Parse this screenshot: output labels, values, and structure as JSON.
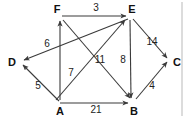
{
  "diagram": {
    "type": "directed-weighted-graph",
    "nodes": [
      {
        "id": "F",
        "label": "F",
        "x": 60,
        "y": 14,
        "lx": 57,
        "ly": 18
      },
      {
        "id": "E",
        "label": "E",
        "x": 130,
        "y": 14,
        "lx": 127,
        "ly": 18
      },
      {
        "id": "D",
        "label": "D",
        "x": 18,
        "y": 62,
        "lx": 9,
        "ly": 66
      },
      {
        "id": "C",
        "label": "C",
        "x": 171,
        "y": 62,
        "lx": 174,
        "ly": 66
      },
      {
        "id": "A",
        "label": "A",
        "x": 60,
        "y": 103,
        "lx": 56,
        "ly": 114
      },
      {
        "id": "B",
        "label": "B",
        "x": 133,
        "y": 103,
        "lx": 130,
        "ly": 114
      }
    ],
    "edges": [
      {
        "from": "F",
        "to": "E",
        "weight": "3",
        "lx": 96,
        "ly": 11
      },
      {
        "from": "E",
        "to": "D",
        "weight": "6",
        "lx": 47,
        "ly": 47
      },
      {
        "from": "A",
        "to": "F",
        "weight": "7",
        "lx": 71,
        "ly": 76
      },
      {
        "from": "F",
        "to": "B",
        "weight": "11",
        "lx": 100,
        "ly": 63
      },
      {
        "from": "A",
        "to": "E",
        "weight": "",
        "lx": 0,
        "ly": 0
      },
      {
        "from": "E",
        "to": "B",
        "weight": "8",
        "lx": 123,
        "ly": 63
      },
      {
        "from": "E",
        "to": "C",
        "weight": "14",
        "lx": 152,
        "ly": 45
      },
      {
        "from": "B",
        "to": "C",
        "weight": "4",
        "lx": 152,
        "ly": 89
      },
      {
        "from": "A",
        "to": "B",
        "weight": "21",
        "lx": 96,
        "ly": 113
      },
      {
        "from": "A",
        "to": "D",
        "weight": "5",
        "lx": 38,
        "ly": 89
      }
    ],
    "colors": {
      "line": "#3a3a3a",
      "node_text": "#111111",
      "edge_text": "#222222",
      "background": "#ffffff",
      "divider": "#b9b9b9"
    }
  }
}
